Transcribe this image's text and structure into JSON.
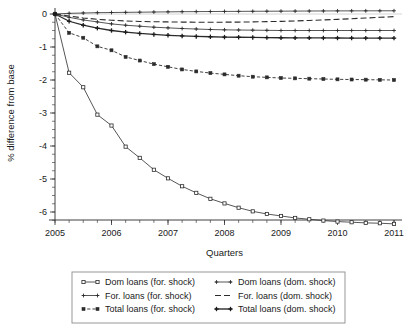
{
  "figure": {
    "background": "#ffffff",
    "ink_color": "#2b2b2b",
    "legend_border_color": "#8d8d8d"
  },
  "chart_data": {
    "type": "line",
    "title": "",
    "xlabel": "Quarters",
    "ylabel": "% difference from base",
    "xlim": [
      2005,
      2011
    ],
    "ylim": [
      -6.6,
      0.35
    ],
    "grid": false,
    "legend_position": "below",
    "xticks": [
      2005,
      2006,
      2007,
      2008,
      2009,
      2010,
      2011
    ],
    "xticklabels": [
      "2005",
      "2006",
      "2007",
      "2008",
      "2009",
      "2010",
      "2011"
    ],
    "minor_xtick_step": 0.25,
    "yticks": [
      0,
      -1,
      -2,
      -3,
      -4,
      -5,
      -6
    ],
    "yticklabels": [
      "0",
      "-1",
      "-2",
      "-3",
      "-4",
      "-5",
      "-6"
    ],
    "minor_ytick_step": 0.25,
    "x": [
      2005,
      2005.25,
      2005.5,
      2005.75,
      2006,
      2006.25,
      2006.5,
      2006.75,
      2007,
      2007.25,
      2007.5,
      2007.75,
      2008,
      2008.25,
      2008.5,
      2008.75,
      2009,
      2009.25,
      2009.5,
      2009.75,
      2010,
      2010.25,
      2010.5,
      2010.75,
      2011
    ],
    "series": [
      {
        "name": "Dom loans (for. shock)",
        "key": "dom_for",
        "linestyle": "solid",
        "linewidth": 0.8,
        "marker": "square-open",
        "color": "#2b2b2b",
        "values": [
          0,
          -1.78,
          -2.22,
          -3.05,
          -3.38,
          -4.02,
          -4.36,
          -4.72,
          -4.98,
          -5.22,
          -5.42,
          -5.6,
          -5.74,
          -5.87,
          -5.98,
          -6.06,
          -6.12,
          -6.18,
          -6.22,
          -6.26,
          -6.29,
          -6.31,
          -6.33,
          -6.34,
          -6.36
        ]
      },
      {
        "name": "For. loans (for. shock)",
        "key": "for_for",
        "linestyle": "solid",
        "linewidth": 0.8,
        "marker": "tick",
        "color": "#2b2b2b",
        "values": [
          0,
          -0.1,
          -0.18,
          -0.24,
          -0.3,
          -0.34,
          -0.37,
          -0.4,
          -0.42,
          -0.44,
          -0.455,
          -0.47,
          -0.48,
          -0.485,
          -0.49,
          -0.495,
          -0.5,
          -0.5,
          -0.5,
          -0.5,
          -0.5,
          -0.5,
          -0.5,
          -0.5,
          -0.5
        ]
      },
      {
        "name": "Total loans (for. shock)",
        "key": "tot_for",
        "linestyle": "dashed",
        "linewidth": 0.9,
        "marker": "square-small",
        "color": "#2b2b2b",
        "values": [
          0,
          -0.57,
          -0.72,
          -0.98,
          -1.1,
          -1.3,
          -1.41,
          -1.52,
          -1.6,
          -1.68,
          -1.74,
          -1.79,
          -1.83,
          -1.87,
          -1.9,
          -1.92,
          -1.94,
          -1.95,
          -1.96,
          -1.97,
          -1.98,
          -1.985,
          -1.99,
          -1.995,
          -2.0
        ]
      },
      {
        "name": "Dom loans (dom. shock)",
        "key": "dom_dom",
        "linestyle": "solid",
        "linewidth": 0.8,
        "marker": "plus",
        "color": "#2b2b2b",
        "values": [
          0,
          0.02,
          0.03,
          0.04,
          0.045,
          0.05,
          0.055,
          0.06,
          0.065,
          0.07,
          0.072,
          0.075,
          0.078,
          0.08,
          0.082,
          0.084,
          0.086,
          0.088,
          0.09,
          0.092,
          0.094,
          0.095,
          0.096,
          0.097,
          0.098
        ]
      },
      {
        "name": "For. loans (dom. shock)",
        "key": "for_dom",
        "linestyle": "longdash",
        "linewidth": 1.1,
        "marker": "none",
        "color": "#2b2b2b",
        "values": [
          0,
          -0.06,
          -0.12,
          -0.16,
          -0.19,
          -0.21,
          -0.225,
          -0.235,
          -0.24,
          -0.245,
          -0.25,
          -0.25,
          -0.248,
          -0.245,
          -0.24,
          -0.232,
          -0.222,
          -0.21,
          -0.195,
          -0.18,
          -0.162,
          -0.142,
          -0.122,
          -0.1,
          -0.08
        ]
      },
      {
        "name": "Total loans (dom. shock)",
        "key": "tot_dom",
        "linestyle": "solid",
        "linewidth": 1.3,
        "marker": "plus-bold",
        "color": "#1a1a1a",
        "values": [
          0,
          -0.22,
          -0.34,
          -0.43,
          -0.5,
          -0.55,
          -0.59,
          -0.62,
          -0.645,
          -0.665,
          -0.68,
          -0.69,
          -0.7,
          -0.705,
          -0.71,
          -0.715,
          -0.72,
          -0.722,
          -0.724,
          -0.726,
          -0.728,
          -0.729,
          -0.73,
          -0.731,
          -0.732
        ]
      }
    ],
    "legend": {
      "columns": 2,
      "entries": [
        {
          "label": "Dom loans (for. shock)",
          "key": "dom_for",
          "column": 0,
          "row": 0
        },
        {
          "label": "For. loans (for. shock)",
          "key": "for_for",
          "column": 0,
          "row": 1
        },
        {
          "label": "Total loans (for. shock)",
          "key": "tot_for",
          "column": 0,
          "row": 2
        },
        {
          "label": "Dom loans (dom. shock)",
          "key": "dom_dom",
          "column": 1,
          "row": 0
        },
        {
          "label": "For. loans (dom. shock)",
          "key": "for_dom",
          "column": 1,
          "row": 1
        },
        {
          "label": "Total loans (dom. shock)",
          "key": "tot_dom",
          "column": 1,
          "row": 2
        }
      ]
    }
  }
}
